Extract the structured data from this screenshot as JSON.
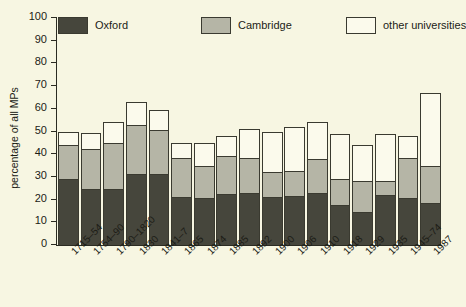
{
  "chart_data": {
    "type": "bar",
    "subtype": "stacked-vertical",
    "title": "",
    "xlabel": "",
    "ylabel": "percentage of all MPs",
    "ylim": [
      0,
      100
    ],
    "ytick_step": 10,
    "yticks": [
      0,
      10,
      20,
      30,
      40,
      50,
      60,
      70,
      80,
      90,
      100
    ],
    "grid": false,
    "legend_position": "top",
    "categories": [
      "1715–54",
      "1754–90",
      "1790–1820",
      "1830",
      "1841–7",
      "1865",
      "1874",
      "1885",
      "1892",
      "1900",
      "1906",
      "1910",
      "1918",
      "1929",
      "1935",
      "1945–74",
      "1987"
    ],
    "series": [
      {
        "name": "Oxford",
        "color": "#46463c",
        "values": [
          29,
          24.5,
          24.5,
          31.5,
          31.5,
          21,
          20.5,
          22.5,
          23,
          21,
          21.5,
          23,
          17.5,
          14.5,
          22,
          20.5,
          18.5
        ]
      },
      {
        "name": "Cambridge",
        "color": "#b5b5a6",
        "values": [
          15,
          18,
          20.5,
          21.5,
          19,
          17.5,
          14.5,
          16.5,
          15.5,
          11,
          11,
          15,
          11.5,
          13.5,
          6,
          18,
          16.5
        ]
      },
      {
        "name": "other universities",
        "color": "#fbfaec",
        "values": [
          6,
          7,
          9,
          10,
          9,
          6.5,
          10,
          9,
          12.5,
          18,
          19.5,
          16,
          20,
          16,
          21,
          9.5,
          32
        ]
      }
    ],
    "totals": [
      50,
      49.5,
      54,
      63,
      59.5,
      45,
      45,
      48,
      51,
      50,
      52,
      54,
      49,
      44,
      49,
      48,
      67
    ]
  },
  "legend": {
    "entries": [
      {
        "label": "Oxford",
        "swatch": "#46463c"
      },
      {
        "label": "Cambridge",
        "swatch": "#b5b5a6"
      },
      {
        "label": "other universities",
        "swatch": "#fbfaec"
      }
    ]
  }
}
